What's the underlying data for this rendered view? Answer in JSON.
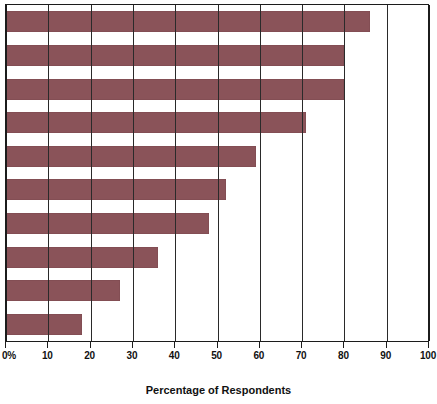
{
  "chart_data": {
    "type": "bar",
    "orientation": "horizontal",
    "title": "",
    "xlabel": "Percentage of Respondents",
    "ylabel": "",
    "xlim": [
      0,
      100
    ],
    "grid": true,
    "legend": "none",
    "bar_color": "#8a5359",
    "axis_color": "#1c1c1c",
    "tick_labels": [
      "0%",
      "10",
      "20",
      "30",
      "40",
      "50",
      "60",
      "70",
      "80",
      "90",
      "100"
    ],
    "tick_values": [
      0,
      10,
      20,
      30,
      40,
      50,
      60,
      70,
      80,
      90,
      100
    ],
    "categories": [
      "",
      "",
      "",
      "",
      "",
      "",
      "",
      "",
      "",
      ""
    ],
    "values": [
      86,
      80,
      80,
      71,
      59,
      52,
      48,
      36,
      27,
      18
    ]
  }
}
